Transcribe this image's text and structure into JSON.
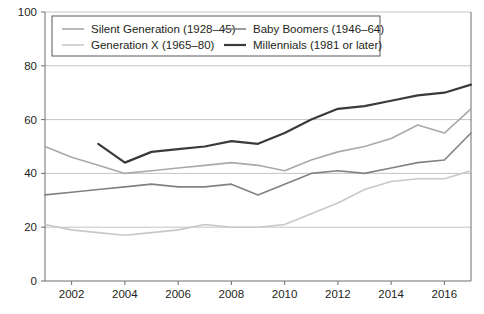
{
  "chart_data": {
    "type": "line",
    "title": "",
    "subtitle": "",
    "xlabel": "",
    "ylabel": "",
    "xlim": [
      2001,
      2017
    ],
    "ylim": [
      0,
      100
    ],
    "grid": true,
    "legend_position": "top-inside",
    "x": [
      2001,
      2002,
      2003,
      2004,
      2005,
      2006,
      2007,
      2008,
      2009,
      2010,
      2011,
      2012,
      2013,
      2014,
      2015,
      2016,
      2017
    ],
    "xticks": [
      "2002",
      "2004",
      "2006",
      "2008",
      "2010",
      "2012",
      "2014",
      "2016"
    ],
    "xtick_values": [
      2002,
      2004,
      2006,
      2008,
      2010,
      2012,
      2014,
      2016
    ],
    "yticks": [
      "0",
      "20",
      "40",
      "60",
      "80",
      "100"
    ],
    "ytick_values": [
      0,
      20,
      40,
      60,
      80,
      100
    ],
    "series": [
      {
        "name": "Silent Generation (1928–45)",
        "color": "#a7a9ac",
        "width": 1.6,
        "values": [
          50,
          46,
          43,
          40,
          41,
          42,
          43,
          44,
          43,
          41,
          45,
          48,
          50,
          53,
          58,
          55,
          64
        ]
      },
      {
        "name": "Generation X (1965–80)",
        "color": "#c7c8ca",
        "width": 1.6,
        "values": [
          21,
          19,
          18,
          17,
          18,
          19,
          21,
          20,
          20,
          21,
          25,
          29,
          34,
          37,
          38,
          38,
          41
        ]
      },
      {
        "name": "Baby Boomers (1946–64)",
        "color": "#808285",
        "width": 1.6,
        "values": [
          32,
          33,
          34,
          35,
          36,
          35,
          35,
          36,
          32,
          36,
          40,
          41,
          40,
          42,
          44,
          45,
          55
        ]
      },
      {
        "name": "Millennials (1981 or later)",
        "color": "#3a3a3c",
        "width": 2.2,
        "values": [
          null,
          null,
          51,
          44,
          48,
          49,
          50,
          52,
          51,
          55,
          60,
          64,
          65,
          67,
          69,
          70,
          73
        ]
      }
    ],
    "legend": [
      {
        "label": "Silent Generation (1928–45)",
        "color": "#a7a9ac",
        "width": 1.6
      },
      {
        "label": "Baby Boomers (1946–64)",
        "color": "#808285",
        "width": 1.6
      },
      {
        "label": "Generation X (1965–80)",
        "color": "#c7c8ca",
        "width": 1.6
      },
      {
        "label": "Millennials (1981 or later)",
        "color": "#3a3a3c",
        "width": 2.2
      }
    ]
  },
  "axes": {
    "plot_left": 45,
    "plot_right": 471,
    "plot_top": 12,
    "plot_bottom": 281
  }
}
